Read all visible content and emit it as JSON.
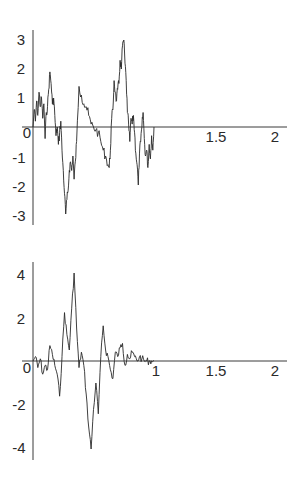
{
  "chart_data": [
    {
      "type": "line",
      "title": "",
      "xlabel": "",
      "ylabel": "",
      "xlim": [
        0,
        2
      ],
      "ylim": [
        -3.2,
        3.3
      ],
      "grid": false,
      "legend": null,
      "x_ticks": [
        "0",
        "1.5",
        "2"
      ],
      "y_ticks": [
        "3",
        "2",
        "1",
        "0",
        "-1",
        "-2",
        "-3"
      ],
      "series": [
        {
          "name": "path 1",
          "x": [
            0.0,
            0.01,
            0.02,
            0.03,
            0.04,
            0.05,
            0.06,
            0.07,
            0.08,
            0.09,
            0.1,
            0.11,
            0.12,
            0.13,
            0.14,
            0.15,
            0.16,
            0.17,
            0.18,
            0.19,
            0.2,
            0.21,
            0.22,
            0.23,
            0.24,
            0.25,
            0.26,
            0.27,
            0.28,
            0.29,
            0.3,
            0.31,
            0.32,
            0.33,
            0.34,
            0.35,
            0.36,
            0.38,
            0.4,
            0.42,
            0.44,
            0.46,
            0.48,
            0.5,
            0.52,
            0.54,
            0.56,
            0.58,
            0.6,
            0.62,
            0.63,
            0.64,
            0.65,
            0.66,
            0.67,
            0.68,
            0.69,
            0.7,
            0.71,
            0.72,
            0.73,
            0.74,
            0.75,
            0.76,
            0.77,
            0.78,
            0.79,
            0.8,
            0.81,
            0.82,
            0.83,
            0.84,
            0.85,
            0.86,
            0.87,
            0.88,
            0.89,
            0.9,
            0.91,
            0.92,
            0.93,
            0.94,
            0.95,
            0.96,
            0.97,
            0.98,
            0.99,
            1.0
          ],
          "values": [
            0.0,
            0.6,
            0.2,
            0.9,
            0.4,
            1.2,
            0.7,
            1.0,
            0.3,
            0.8,
            -0.4,
            0.5,
            0.7,
            1.3,
            1.9,
            1.5,
            0.8,
            1.0,
            0.4,
            -0.3,
            0.0,
            -0.6,
            -0.2,
            0.2,
            -0.8,
            -1.5,
            -2.3,
            -3.0,
            -2.5,
            -2.2,
            -1.5,
            -1.2,
            -1.5,
            -1.0,
            -1.8,
            -1.2,
            -0.5,
            1.4,
            1.1,
            0.8,
            0.7,
            0.4,
            0.1,
            0.0,
            -0.1,
            -0.2,
            -0.5,
            -0.8,
            -1.0,
            -1.3,
            -1.4,
            -0.8,
            0.3,
            0.6,
            1.6,
            1.2,
            0.9,
            1.3,
            1.5,
            2.3,
            2.0,
            2.8,
            3.0,
            2.2,
            1.6,
            0.5,
            0.1,
            -0.5,
            0.3,
            0.1,
            0.4,
            -0.2,
            -0.9,
            -1.3,
            -2.0,
            -0.9,
            -0.5,
            0.0,
            0.5,
            -0.4,
            -1.0,
            -0.8,
            -1.4,
            -0.6,
            -1.1,
            -0.3,
            -0.8,
            0.0
          ]
        }
      ]
    },
    {
      "type": "line",
      "title": "",
      "xlabel": "",
      "ylabel": "",
      "xlim": [
        0,
        2
      ],
      "ylim": [
        -4.5,
        4.5
      ],
      "grid": false,
      "legend": null,
      "x_ticks": [
        "0",
        "1",
        "1.5",
        "2"
      ],
      "y_ticks": [
        "4",
        "2",
        "0",
        "-2",
        "-4"
      ],
      "series": [
        {
          "name": "path 2",
          "x": [
            0.0,
            0.02,
            0.04,
            0.06,
            0.08,
            0.1,
            0.12,
            0.14,
            0.16,
            0.18,
            0.2,
            0.22,
            0.24,
            0.26,
            0.28,
            0.3,
            0.32,
            0.34,
            0.36,
            0.38,
            0.4,
            0.42,
            0.44,
            0.46,
            0.48,
            0.5,
            0.52,
            0.54,
            0.56,
            0.58,
            0.6,
            0.62,
            0.64,
            0.66,
            0.68,
            0.7,
            0.72,
            0.74,
            0.76,
            0.78,
            0.8,
            0.82,
            0.84,
            0.86,
            0.88,
            0.9,
            0.92,
            0.94,
            0.96,
            0.98,
            1.0
          ],
          "values": [
            0.0,
            0.2,
            -0.3,
            0.1,
            -0.6,
            -0.2,
            -0.4,
            0.7,
            0.3,
            -0.2,
            -0.6,
            -1.6,
            0.2,
            2.2,
            1.2,
            0.5,
            2.4,
            4.0,
            1.5,
            -0.3,
            0.4,
            -0.2,
            -1.5,
            -3.0,
            -4.0,
            -2.2,
            -1.0,
            -2.4,
            0.2,
            1.6,
            0.5,
            0.2,
            -0.4,
            -0.8,
            0.4,
            0.2,
            0.6,
            0.8,
            -0.2,
            0.3,
            0.1,
            0.4,
            0.2,
            0.0,
            0.2,
            0.1,
            0.0,
            0.0,
            0.0,
            0.0,
            0.0
          ]
        }
      ]
    }
  ],
  "panels": {
    "top": {
      "x_labels": [
        "0",
        "1.5",
        "2"
      ],
      "y_labels": [
        "3",
        "2",
        "1",
        "0",
        "-1",
        "-2",
        "-3"
      ]
    },
    "bottom": {
      "x_labels": [
        "0",
        "1",
        "1.5",
        "2"
      ],
      "y_labels": [
        "4",
        "2",
        "0",
        "-2",
        "-4"
      ]
    }
  }
}
